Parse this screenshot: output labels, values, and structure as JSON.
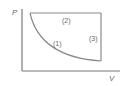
{
  "diagram": {
    "type": "pv-cycle",
    "axes": {
      "y_label": "P",
      "x_label": "V"
    },
    "process_labels": {
      "p1": "(1)",
      "p2": "(2)",
      "p3": "(3)"
    },
    "colors": {
      "axis": "#7a7a7a",
      "process": "#8a8a8a",
      "text": "#6a6a6a"
    }
  }
}
